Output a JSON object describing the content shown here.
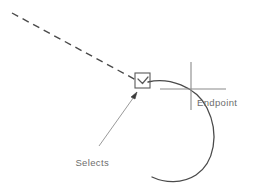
{
  "diagram": {
    "background_color": "#ffffff",
    "stroke_color": "#4a4a4a",
    "text_color": "#6d6d6d",
    "labels": {
      "endpoint": "Endpoint",
      "selects_line1": "Selects",
      "selects_line2": "endpoint"
    },
    "shapes": {
      "dashed_line": {
        "name": "crosshair-guide-dashed-line",
        "x1": 12,
        "y1": 13,
        "x2": 137,
        "y2": 81,
        "dash": "7 5"
      },
      "arc": {
        "name": "arc-geometry",
        "description": "large open arc opening toward the left"
      },
      "selection_box": {
        "name": "pickbox",
        "x": 135,
        "y": 73,
        "width": 15,
        "height": 15
      },
      "osnap_marker": {
        "name": "endpoint-osnap-marker",
        "description": "small v-shaped marker inside pickbox"
      },
      "crosshair": {
        "name": "endpoint-crosshair",
        "vertical_x": 191,
        "vertical_y1": 62,
        "vertical_y2": 110,
        "horizontal_y": 89,
        "horizontal_x1": 160,
        "horizontal_x2": 226
      },
      "leader": {
        "name": "selects-endpoint-leader-line",
        "x1": 99,
        "y1": 146,
        "x2": 137,
        "y2": 93
      }
    }
  }
}
